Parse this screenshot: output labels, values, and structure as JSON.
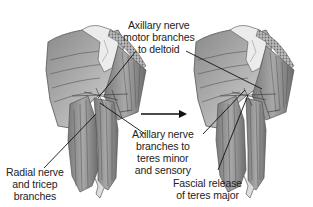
{
  "diagram": {
    "type": "anatomical-illustration",
    "panels": [
      {
        "id": "before",
        "description": "posterior shoulder musculature with axillary and radial nerve branches"
      },
      {
        "id": "after",
        "description": "posterior shoulder after fascial release of teres major"
      }
    ],
    "transition_arrow": {
      "direction": "right",
      "from_panel": "before",
      "to_panel": "after"
    },
    "labels": {
      "axillary_motor": {
        "lines": [
          "Axillary nerve",
          "motor branches",
          "to deltoid"
        ]
      },
      "axillary_teres": {
        "lines": [
          "Axillary nerve",
          "branches to",
          "teres minor",
          "and sensory"
        ]
      },
      "radial": {
        "lines": [
          "Radial nerve",
          "and tricep",
          "branches"
        ]
      },
      "fascial": {
        "lines": [
          "Fascial release",
          "of teres major"
        ]
      }
    },
    "colors": {
      "background": "#ffffff",
      "muscle_dark": "#6e6e6e",
      "muscle_mid": "#9a9a9a",
      "muscle_light": "#cfcfcf",
      "bone": "#e6e6e6",
      "line": "#111111",
      "text": "#222222"
    }
  }
}
